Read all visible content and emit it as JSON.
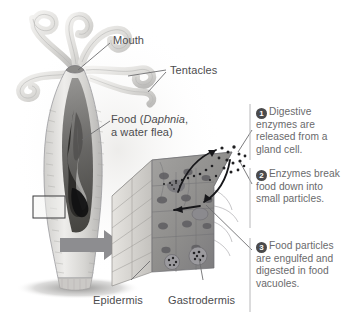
{
  "figure": {
    "background": "#ffffff",
    "ink": "#58585a"
  },
  "labels": {
    "mouth": "Mouth",
    "tentacles": "Tentacles",
    "food_line1": "Food (",
    "food_italic": "Daphnia",
    "food_line1_end": ",",
    "food_line2": "a water flea)",
    "epidermis": "Epidermis",
    "gastrodermis": "Gastrodermis"
  },
  "callouts": [
    {
      "number": "1",
      "text": "Digestive enzymes are released from a gland cell."
    },
    {
      "number": "2",
      "text": "Enzymes break food down into small particles."
    },
    {
      "number": "3",
      "text": "Food particles are engulfed and digested in food vacuoles."
    }
  ],
  "colors": {
    "badge_fill": "#4a4a4c",
    "badge_text": "#ffffff",
    "callout_text": "#6a6a6c",
    "label_text": "#4c4c4e",
    "leader_line": "#6e6e70",
    "divider": "#b8b8ba",
    "big_arrow": "#8d8d90",
    "tissue_dark": "#8e8e91",
    "tissue_light": "#d8d6d2",
    "body_outline": "#9b9b9e",
    "food_mass": "#1c1c1e"
  }
}
